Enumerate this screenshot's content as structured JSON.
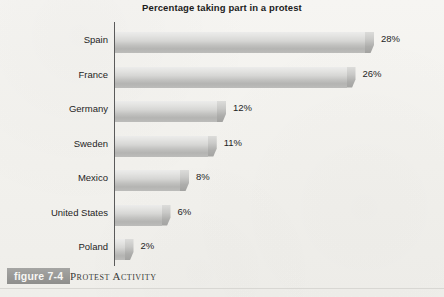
{
  "figure": {
    "tag": "figure 7-4",
    "caption": "Protest Activity"
  },
  "chart_data": {
    "type": "bar",
    "orientation": "horizontal",
    "title": "Percentage taking part in a protest",
    "xlabel": "",
    "ylabel": "",
    "xlim": [
      0,
      30
    ],
    "grid": false,
    "legend": null,
    "categories": [
      "Spain",
      "France",
      "Germany",
      "Sweden",
      "Mexico",
      "United States",
      "Poland"
    ],
    "values": [
      28,
      26,
      12,
      11,
      8,
      6,
      2
    ],
    "value_labels": [
      "28%",
      "26%",
      "12%",
      "11%",
      "8%",
      "6%",
      "2%"
    ],
    "colors": {
      "bar_light": "#ececeb",
      "bar_dark": "#b4b4b2",
      "axis": "#5a5a5a",
      "text": "#1e1e1e",
      "background": "#f4f3f0",
      "tag_background": "#999997"
    }
  }
}
